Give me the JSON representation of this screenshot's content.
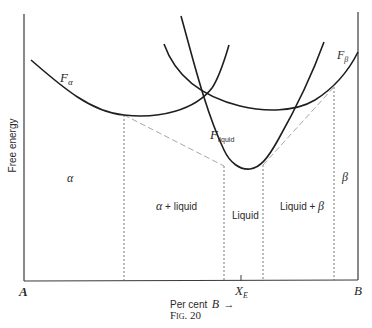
{
  "figure": {
    "caption": "Fig. 20",
    "y_axis_label": "Free energy",
    "x_axis_label": "Per cent",
    "x_axis_var": "B",
    "x_axis_arrow": "→",
    "left_end": "A",
    "right_end": "B",
    "eutectic_label": "X",
    "eutectic_sub": "E"
  },
  "curves": {
    "f_alpha": {
      "main": "F",
      "sub": "α"
    },
    "f_beta": {
      "main": "F",
      "sub": "β"
    },
    "f_liquid": {
      "main": "F",
      "sub": "liquid"
    }
  },
  "regions": {
    "alpha": "α",
    "alpha_liquid_pre": "α",
    "alpha_liquid_post": " + liquid",
    "liquid": "Liquid",
    "liquid_beta_pre": "Liquid + ",
    "liquid_beta_post": "β",
    "beta": "β"
  },
  "colors": {
    "curve": "#1e1e1e",
    "axis": "#3a3a3a",
    "tangent": "#a8a8a8",
    "dashed": "#555555"
  }
}
